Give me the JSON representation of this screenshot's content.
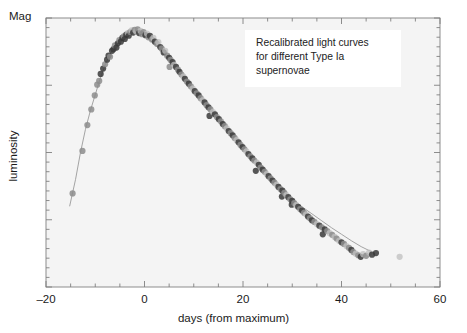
{
  "figure": {
    "mag_label": "Mag",
    "ylabel": "luminosity",
    "xlabel": "days (from maximum)",
    "annotation": {
      "line1": "Recalibrated light curves",
      "line2": "for different Type Ia",
      "line3": "supernovae"
    },
    "colors": {
      "page_background": "#ffffff",
      "plot_background": "#f4f4f4",
      "axis": "#808080",
      "text": "#1a1a1a",
      "annotation_background": "#ffffff",
      "trend_line": "#9a9a9a",
      "point_dark": "#3a3a3a",
      "point_mid": "#8c8c8c",
      "point_light": "#bfbfbf"
    }
  },
  "chart_data": {
    "type": "scatter",
    "title": "",
    "subtitle": "",
    "xlabel": "days (from maximum)",
    "ylabel": "luminosity",
    "corner_label": "Mag",
    "xlim": [
      -20,
      60
    ],
    "ylim": [
      0,
      1
    ],
    "xticks": [
      -20,
      0,
      20,
      40,
      60
    ],
    "xtick_labels": [
      "–20",
      "0",
      "20",
      "40",
      "60"
    ],
    "xminor_tick_step": 5,
    "yticks_labeled": [],
    "yminor_ticks": 28,
    "grid": false,
    "legend": null,
    "annotations": [
      {
        "text": "Recalibrated light curves for different Type Ia supernovae",
        "x": 22,
        "y": 0.93,
        "boxed": true
      }
    ],
    "series": [
      {
        "name": "recalibrated light curve (template fit)",
        "type": "line",
        "color": "#9a9a9a",
        "x": [
          -15.2,
          -14.0,
          -13.0,
          -12.0,
          -11.0,
          -10.0,
          -9.0,
          -8.0,
          -7.0,
          -6.0,
          -5.0,
          -4.0,
          -3.0,
          -2.0,
          -1.0,
          0.0,
          1.0,
          2.0,
          3.0,
          4.0,
          5.0,
          6.0,
          7.0,
          8.0,
          9.0,
          10.0,
          12.0,
          14.0,
          16.0,
          18.0,
          20.0,
          22.0,
          24.0,
          26.0,
          28.0,
          30.0,
          32.0,
          34.0,
          36.0,
          38.0,
          40.0,
          42.0,
          44.0,
          46.0
        ],
        "y": [
          0.3,
          0.4,
          0.5,
          0.585,
          0.655,
          0.715,
          0.775,
          0.825,
          0.865,
          0.895,
          0.918,
          0.935,
          0.945,
          0.948,
          0.944,
          0.934,
          0.92,
          0.903,
          0.884,
          0.864,
          0.843,
          0.822,
          0.8,
          0.778,
          0.756,
          0.734,
          0.69,
          0.646,
          0.602,
          0.558,
          0.514,
          0.47,
          0.428,
          0.39,
          0.356,
          0.326,
          0.298,
          0.272,
          0.246,
          0.22,
          0.196,
          0.172,
          0.15,
          0.132
        ]
      },
      {
        "name": "Type Ia supernova photometry (recalibrated points)",
        "type": "scatter",
        "points": [
          {
            "x": -14.6,
            "y": 0.348,
            "shade": "mid"
          },
          {
            "x": -12.6,
            "y": 0.506,
            "shade": "mid"
          },
          {
            "x": -11.6,
            "y": 0.602,
            "shade": "mid"
          },
          {
            "x": -10.8,
            "y": 0.66,
            "shade": "mid"
          },
          {
            "x": -10.1,
            "y": 0.712,
            "shade": "mid"
          },
          {
            "x": -9.6,
            "y": 0.752,
            "shade": "mid"
          },
          {
            "x": -9.2,
            "y": 0.766,
            "shade": "mid"
          },
          {
            "x": -8.9,
            "y": 0.792,
            "shade": "dark"
          },
          {
            "x": -8.4,
            "y": 0.812,
            "shade": "dark"
          },
          {
            "x": -8.0,
            "y": 0.828,
            "shade": "mid"
          },
          {
            "x": -7.6,
            "y": 0.845,
            "shade": "dark"
          },
          {
            "x": -7.3,
            "y": 0.86,
            "shade": "dark"
          },
          {
            "x": -7.0,
            "y": 0.856,
            "shade": "mid"
          },
          {
            "x": -6.6,
            "y": 0.878,
            "shade": "dark"
          },
          {
            "x": -6.3,
            "y": 0.884,
            "shade": "dark"
          },
          {
            "x": -6.0,
            "y": 0.898,
            "shade": "mid"
          },
          {
            "x": -5.7,
            "y": 0.89,
            "shade": "dark"
          },
          {
            "x": -5.4,
            "y": 0.906,
            "shade": "dark"
          },
          {
            "x": -5.1,
            "y": 0.918,
            "shade": "mid"
          },
          {
            "x": -4.8,
            "y": 0.912,
            "shade": "dark"
          },
          {
            "x": -4.5,
            "y": 0.926,
            "shade": "dark"
          },
          {
            "x": -4.2,
            "y": 0.932,
            "shade": "mid"
          },
          {
            "x": -4.0,
            "y": 0.922,
            "shade": "dark"
          },
          {
            "x": -3.7,
            "y": 0.938,
            "shade": "dark"
          },
          {
            "x": -3.4,
            "y": 0.944,
            "shade": "light"
          },
          {
            "x": -3.2,
            "y": 0.934,
            "shade": "dark"
          },
          {
            "x": -2.9,
            "y": 0.948,
            "shade": "mid"
          },
          {
            "x": -2.6,
            "y": 0.954,
            "shade": "light"
          },
          {
            "x": -2.3,
            "y": 0.946,
            "shade": "dark"
          },
          {
            "x": -2.0,
            "y": 0.956,
            "shade": "mid"
          },
          {
            "x": -1.7,
            "y": 0.95,
            "shade": "light"
          },
          {
            "x": -1.4,
            "y": 0.958,
            "shade": "mid"
          },
          {
            "x": -1.1,
            "y": 0.944,
            "shade": "dark"
          },
          {
            "x": -0.8,
            "y": 0.952,
            "shade": "light"
          },
          {
            "x": -0.5,
            "y": 0.94,
            "shade": "mid"
          },
          {
            "x": -0.2,
            "y": 0.948,
            "shade": "mid"
          },
          {
            "x": 0.2,
            "y": 0.936,
            "shade": "dark"
          },
          {
            "x": 0.5,
            "y": 0.942,
            "shade": "light"
          },
          {
            "x": 0.8,
            "y": 0.928,
            "shade": "mid"
          },
          {
            "x": 1.1,
            "y": 0.934,
            "shade": "dark"
          },
          {
            "x": 1.5,
            "y": 0.92,
            "shade": "mid"
          },
          {
            "x": 1.8,
            "y": 0.926,
            "shade": "light"
          },
          {
            "x": 2.1,
            "y": 0.912,
            "shade": "dark"
          },
          {
            "x": 2.5,
            "y": 0.904,
            "shade": "mid"
          },
          {
            "x": 2.8,
            "y": 0.91,
            "shade": "light"
          },
          {
            "x": 3.2,
            "y": 0.892,
            "shade": "dark"
          },
          {
            "x": 3.5,
            "y": 0.886,
            "shade": "mid"
          },
          {
            "x": 3.9,
            "y": 0.872,
            "shade": "dark"
          },
          {
            "x": 4.2,
            "y": 0.878,
            "shade": "light"
          },
          {
            "x": 4.6,
            "y": 0.86,
            "shade": "mid"
          },
          {
            "x": 5.0,
            "y": 0.852,
            "shade": "dark"
          },
          {
            "x": 5.3,
            "y": 0.844,
            "shade": "mid"
          },
          {
            "x": 5.1,
            "y": 0.818,
            "shade": "mid"
          },
          {
            "x": 5.7,
            "y": 0.836,
            "shade": "dark"
          },
          {
            "x": 6.0,
            "y": 0.826,
            "shade": "light"
          },
          {
            "x": 6.4,
            "y": 0.818,
            "shade": "dark"
          },
          {
            "x": 6.8,
            "y": 0.808,
            "shade": "mid"
          },
          {
            "x": 7.1,
            "y": 0.8,
            "shade": "dark"
          },
          {
            "x": 7.5,
            "y": 0.79,
            "shade": "mid"
          },
          {
            "x": 7.9,
            "y": 0.782,
            "shade": "light"
          },
          {
            "x": 8.2,
            "y": 0.774,
            "shade": "dark"
          },
          {
            "x": 8.6,
            "y": 0.764,
            "shade": "mid"
          },
          {
            "x": 9.0,
            "y": 0.756,
            "shade": "dark"
          },
          {
            "x": 9.4,
            "y": 0.746,
            "shade": "mid"
          },
          {
            "x": 9.8,
            "y": 0.738,
            "shade": "light"
          },
          {
            "x": 10.2,
            "y": 0.728,
            "shade": "dark"
          },
          {
            "x": 10.6,
            "y": 0.72,
            "shade": "mid"
          },
          {
            "x": 11.0,
            "y": 0.712,
            "shade": "dark"
          },
          {
            "x": 11.4,
            "y": 0.702,
            "shade": "mid"
          },
          {
            "x": 11.8,
            "y": 0.694,
            "shade": "light"
          },
          {
            "x": 12.2,
            "y": 0.686,
            "shade": "dark"
          },
          {
            "x": 12.6,
            "y": 0.676,
            "shade": "mid"
          },
          {
            "x": 13.0,
            "y": 0.668,
            "shade": "dark"
          },
          {
            "x": 13.4,
            "y": 0.66,
            "shade": "mid"
          },
          {
            "x": 13.2,
            "y": 0.636,
            "shade": "dark"
          },
          {
            "x": 13.9,
            "y": 0.65,
            "shade": "light"
          },
          {
            "x": 14.3,
            "y": 0.642,
            "shade": "dark"
          },
          {
            "x": 14.7,
            "y": 0.632,
            "shade": "mid"
          },
          {
            "x": 15.1,
            "y": 0.624,
            "shade": "dark"
          },
          {
            "x": 15.5,
            "y": 0.616,
            "shade": "mid"
          },
          {
            "x": 15.9,
            "y": 0.606,
            "shade": "dark"
          },
          {
            "x": 16.3,
            "y": 0.598,
            "shade": "mid"
          },
          {
            "x": 16.7,
            "y": 0.59,
            "shade": "light"
          },
          {
            "x": 17.1,
            "y": 0.58,
            "shade": "dark"
          },
          {
            "x": 17.5,
            "y": 0.572,
            "shade": "mid"
          },
          {
            "x": 17.9,
            "y": 0.564,
            "shade": "dark"
          },
          {
            "x": 18.3,
            "y": 0.554,
            "shade": "mid"
          },
          {
            "x": 18.7,
            "y": 0.546,
            "shade": "light"
          },
          {
            "x": 19.1,
            "y": 0.538,
            "shade": "dark"
          },
          {
            "x": 19.5,
            "y": 0.528,
            "shade": "mid"
          },
          {
            "x": 19.9,
            "y": 0.52,
            "shade": "dark"
          },
          {
            "x": 20.3,
            "y": 0.512,
            "shade": "mid"
          },
          {
            "x": 20.7,
            "y": 0.504,
            "shade": "light"
          },
          {
            "x": 21.1,
            "y": 0.494,
            "shade": "dark"
          },
          {
            "x": 21.5,
            "y": 0.486,
            "shade": "mid"
          },
          {
            "x": 21.9,
            "y": 0.478,
            "shade": "dark"
          },
          {
            "x": 22.3,
            "y": 0.47,
            "shade": "mid"
          },
          {
            "x": 22.6,
            "y": 0.432,
            "shade": "dark"
          },
          {
            "x": 22.8,
            "y": 0.462,
            "shade": "light"
          },
          {
            "x": 23.2,
            "y": 0.454,
            "shade": "dark"
          },
          {
            "x": 23.6,
            "y": 0.444,
            "shade": "mid"
          },
          {
            "x": 24.0,
            "y": 0.436,
            "shade": "dark"
          },
          {
            "x": 24.4,
            "y": 0.428,
            "shade": "mid"
          },
          {
            "x": 24.8,
            "y": 0.42,
            "shade": "light"
          },
          {
            "x": 25.2,
            "y": 0.412,
            "shade": "dark"
          },
          {
            "x": 25.6,
            "y": 0.404,
            "shade": "mid"
          },
          {
            "x": 26.0,
            "y": 0.396,
            "shade": "dark"
          },
          {
            "x": 26.4,
            "y": 0.388,
            "shade": "mid"
          },
          {
            "x": 26.8,
            "y": 0.38,
            "shade": "light"
          },
          {
            "x": 27.2,
            "y": 0.372,
            "shade": "dark"
          },
          {
            "x": 27.6,
            "y": 0.364,
            "shade": "mid"
          },
          {
            "x": 27.9,
            "y": 0.336,
            "shade": "dark"
          },
          {
            "x": 28.0,
            "y": 0.358,
            "shade": "dark"
          },
          {
            "x": 28.4,
            "y": 0.35,
            "shade": "mid"
          },
          {
            "x": 28.8,
            "y": 0.342,
            "shade": "light"
          },
          {
            "x": 29.2,
            "y": 0.334,
            "shade": "dark"
          },
          {
            "x": 29.6,
            "y": 0.326,
            "shade": "mid"
          },
          {
            "x": 29.9,
            "y": 0.306,
            "shade": "dark"
          },
          {
            "x": 30.0,
            "y": 0.32,
            "shade": "dark"
          },
          {
            "x": 30.4,
            "y": 0.312,
            "shade": "mid"
          },
          {
            "x": 30.8,
            "y": 0.304,
            "shade": "light"
          },
          {
            "x": 31.2,
            "y": 0.298,
            "shade": "dark"
          },
          {
            "x": 31.6,
            "y": 0.29,
            "shade": "mid"
          },
          {
            "x": 32.0,
            "y": 0.284,
            "shade": "dark"
          },
          {
            "x": 32.4,
            "y": 0.276,
            "shade": "mid"
          },
          {
            "x": 32.8,
            "y": 0.27,
            "shade": "light"
          },
          {
            "x": 33.2,
            "y": 0.262,
            "shade": "dark"
          },
          {
            "x": 33.6,
            "y": 0.256,
            "shade": "mid"
          },
          {
            "x": 34.0,
            "y": 0.248,
            "shade": "dark"
          },
          {
            "x": 34.5,
            "y": 0.242,
            "shade": "mid"
          },
          {
            "x": 35.0,
            "y": 0.234,
            "shade": "light"
          },
          {
            "x": 35.5,
            "y": 0.228,
            "shade": "dark"
          },
          {
            "x": 36.0,
            "y": 0.222,
            "shade": "mid"
          },
          {
            "x": 36.2,
            "y": 0.196,
            "shade": "dark"
          },
          {
            "x": 36.6,
            "y": 0.214,
            "shade": "dark"
          },
          {
            "x": 37.1,
            "y": 0.208,
            "shade": "mid"
          },
          {
            "x": 37.6,
            "y": 0.2,
            "shade": "light"
          },
          {
            "x": 38.1,
            "y": 0.194,
            "shade": "mid"
          },
          {
            "x": 38.6,
            "y": 0.186,
            "shade": "light"
          },
          {
            "x": 39.0,
            "y": 0.18,
            "shade": "mid"
          },
          {
            "x": 39.5,
            "y": 0.172,
            "shade": "light"
          },
          {
            "x": 40.0,
            "y": 0.166,
            "shade": "dark"
          },
          {
            "x": 40.5,
            "y": 0.16,
            "shade": "mid"
          },
          {
            "x": 41.0,
            "y": 0.152,
            "shade": "light"
          },
          {
            "x": 41.5,
            "y": 0.146,
            "shade": "mid"
          },
          {
            "x": 42.0,
            "y": 0.138,
            "shade": "dark"
          },
          {
            "x": 42.4,
            "y": 0.13,
            "shade": "mid"
          },
          {
            "x": 42.9,
            "y": 0.124,
            "shade": "light"
          },
          {
            "x": 43.4,
            "y": 0.118,
            "shade": "mid"
          },
          {
            "x": 43.9,
            "y": 0.112,
            "shade": "dark"
          },
          {
            "x": 44.4,
            "y": 0.122,
            "shade": "light"
          },
          {
            "x": 45.0,
            "y": 0.116,
            "shade": "mid"
          },
          {
            "x": 45.6,
            "y": 0.128,
            "shade": "light"
          },
          {
            "x": 46.2,
            "y": 0.12,
            "shade": "dark"
          },
          {
            "x": 47.0,
            "y": 0.126,
            "shade": "dark"
          },
          {
            "x": 51.8,
            "y": 0.112,
            "shade": "light"
          }
        ]
      }
    ]
  }
}
